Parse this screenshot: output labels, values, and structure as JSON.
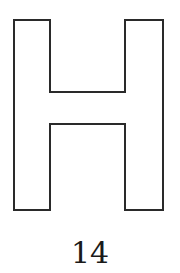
{
  "figure": {
    "shape": "letter-H-outline",
    "label": "14",
    "stroke_color": "#2a2a2a",
    "fill_color": "#ffffff"
  }
}
